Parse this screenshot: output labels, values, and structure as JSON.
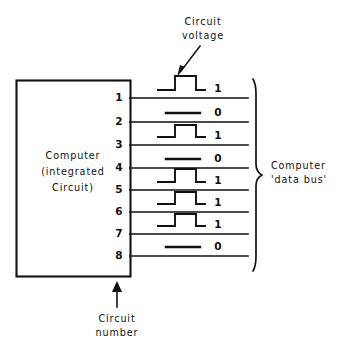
{
  "diagram": {
    "colors": {
      "ink": "#111111",
      "background": "#ffffff"
    },
    "component": {
      "label_lines": [
        "Computer",
        "(integrated",
        "Circuit)"
      ]
    },
    "callouts": {
      "circuit_voltage": {
        "lines": [
          "Circuit",
          "voltage"
        ]
      },
      "circuit_number": {
        "lines": [
          "Circuit",
          "number"
        ]
      },
      "data_bus": {
        "lines": [
          "Computer",
          "'data bus'"
        ]
      }
    },
    "circuits": [
      {
        "pin": "1",
        "bit": "1",
        "waveform": "pulse"
      },
      {
        "pin": "2",
        "bit": "0",
        "waveform": "flat"
      },
      {
        "pin": "3",
        "bit": "1",
        "waveform": "pulse"
      },
      {
        "pin": "4",
        "bit": "0",
        "waveform": "flat"
      },
      {
        "pin": "5",
        "bit": "1",
        "waveform": "pulse"
      },
      {
        "pin": "6",
        "bit": "1",
        "waveform": "pulse"
      },
      {
        "pin": "7",
        "bit": "1",
        "waveform": "pulse"
      },
      {
        "pin": "8",
        "bit": "0",
        "waveform": "flat"
      }
    ]
  }
}
